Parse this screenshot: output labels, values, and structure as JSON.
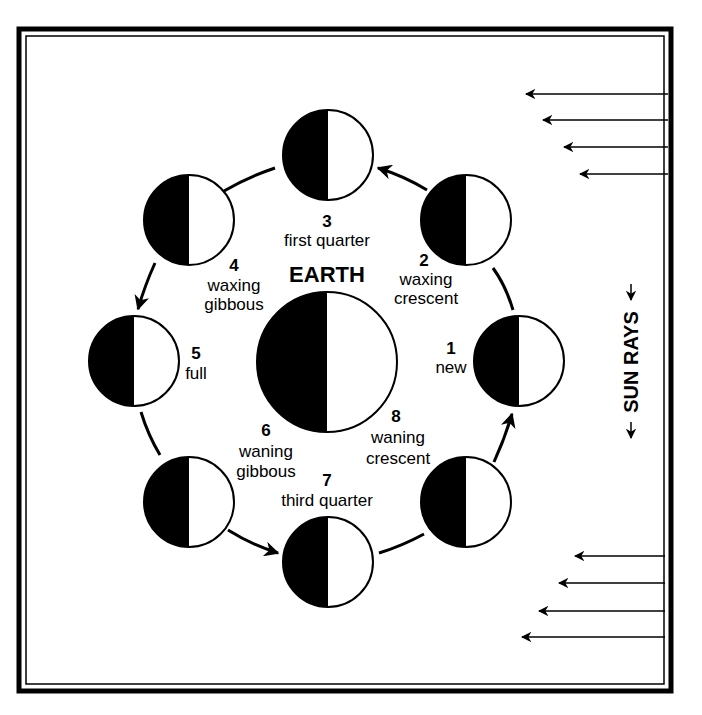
{
  "diagram": {
    "type": "moon-phases",
    "center_label": "EARTH",
    "side_label": "SUN RAYS",
    "colors": {
      "ink": "#000000",
      "paper": "#ffffff"
    },
    "phases": [
      {
        "number": "1",
        "name_line1": "new",
        "name_line2": ""
      },
      {
        "number": "2",
        "name_line1": "waxing",
        "name_line2": "crescent"
      },
      {
        "number": "3",
        "name_line1": "first quarter",
        "name_line2": ""
      },
      {
        "number": "4",
        "name_line1": "waxing",
        "name_line2": "gibbous"
      },
      {
        "number": "5",
        "name_line1": "full",
        "name_line2": ""
      },
      {
        "number": "6",
        "name_line1": "waning",
        "name_line2": "gibbous"
      },
      {
        "number": "7",
        "name_line1": "third quarter",
        "name_line2": ""
      },
      {
        "number": "8",
        "name_line1": "waning",
        "name_line2": "crescent"
      }
    ],
    "sun_rays_top_count": 4,
    "sun_rays_bottom_count": 4
  }
}
